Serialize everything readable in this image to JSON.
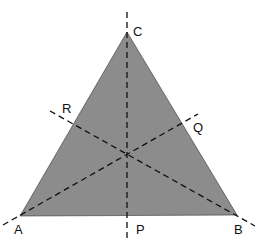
{
  "diagram": {
    "fill_color": "#8c8c8c",
    "line_color": "#111111",
    "vertices": {
      "A": {
        "label": "A",
        "x": 20,
        "y": 216
      },
      "B": {
        "label": "B",
        "x": 237,
        "y": 215
      },
      "C": {
        "label": "C",
        "x": 127,
        "y": 32
      }
    },
    "points": {
      "P": {
        "label": "P",
        "x": 127,
        "y": 216
      },
      "Q": {
        "label": "Q",
        "x": 183,
        "y": 123
      },
      "R": {
        "label": "R",
        "x": 73,
        "y": 124
      }
    },
    "centroid": {
      "x": 127,
      "y": 154
    },
    "dashed_lines": [
      {
        "name": "CP",
        "x1": 127,
        "y1": 12,
        "x2": 127,
        "y2": 240
      },
      {
        "name": "AQ",
        "x1": 3,
        "y1": 225,
        "x2": 198,
        "y2": 114
      },
      {
        "name": "BR",
        "x1": 50,
        "y1": 111,
        "x2": 255,
        "y2": 226
      }
    ],
    "labels": [
      {
        "text": "C",
        "x": 133,
        "y": 36
      },
      {
        "text": "R",
        "x": 62,
        "y": 113
      },
      {
        "text": "Q",
        "x": 193,
        "y": 132
      },
      {
        "text": "A",
        "x": 14,
        "y": 234
      },
      {
        "text": "P",
        "x": 136,
        "y": 234
      },
      {
        "text": "B",
        "x": 234,
        "y": 234
      }
    ]
  }
}
